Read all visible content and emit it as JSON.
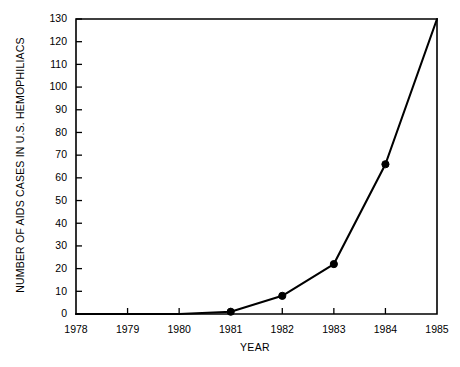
{
  "chart_data": {
    "type": "line",
    "title": "",
    "subtitle": "",
    "xlabel": "YEAR",
    "ylabel": "NUMBER OF AIDS CASES IN U.S. HEMOPHILIACS",
    "x": [
      1978,
      1979,
      1980,
      1981,
      1982,
      1983,
      1984,
      1985
    ],
    "categories": [
      "1978",
      "1979",
      "1980",
      "1981",
      "1982",
      "1983",
      "1984",
      "1985"
    ],
    "values": [
      0,
      0,
      0,
      1,
      8,
      22,
      66,
      130
    ],
    "series": [
      {
        "name": "AIDS cases in U.S. hemophiliacs",
        "values": [
          0,
          0,
          0,
          1,
          8,
          22,
          66,
          130
        ],
        "color": "#000000",
        "marker": "filled-circle",
        "markers_at": [
          1981,
          1982,
          1983,
          1984
        ]
      }
    ],
    "xlim": [
      1978,
      1985
    ],
    "ylim": [
      0,
      130
    ],
    "ytick_step": 10,
    "xtick_step": 1,
    "xticks": [
      "1978",
      "1979",
      "1980",
      "1981",
      "1982",
      "1983",
      "1984",
      "1985"
    ],
    "yticks": [
      "0",
      "10",
      "20",
      "30",
      "40",
      "50",
      "60",
      "70",
      "80",
      "90",
      "100",
      "110",
      "120",
      "130"
    ],
    "grid": false,
    "legend": false,
    "legend_position": "none",
    "annotations": [],
    "colors": {
      "line": "#000000",
      "axis": "#000000",
      "background": "#ffffff",
      "text": "#000000"
    }
  }
}
